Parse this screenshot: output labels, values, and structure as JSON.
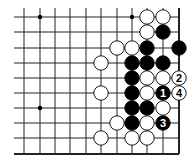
{
  "board": {
    "columns_x": [
      24,
      40,
      55,
      70,
      86,
      101,
      117,
      132,
      147,
      163,
      179
    ],
    "rows_y": [
      17,
      32,
      48,
      63,
      78,
      93,
      108,
      123,
      138,
      154
    ],
    "line_left": 14,
    "line_top": 8,
    "edges": {
      "top": false,
      "left": false,
      "right": true,
      "bottom": true
    },
    "stone_radius": 7.2,
    "colors": {
      "black": "#000000",
      "white": "#ffffff",
      "line": "#222222"
    },
    "star_points": [
      [
        1,
        0
      ],
      [
        7,
        0
      ],
      [
        1,
        6
      ]
    ]
  },
  "stones": [
    {
      "col": 8,
      "row": 0,
      "color": "white"
    },
    {
      "col": 9,
      "row": 0,
      "color": "white"
    },
    {
      "col": 8,
      "row": 1,
      "color": "white"
    },
    {
      "col": 9,
      "row": 1,
      "color": "black"
    },
    {
      "col": 6,
      "row": 2,
      "color": "white"
    },
    {
      "col": 7,
      "row": 2,
      "color": "white"
    },
    {
      "col": 8,
      "row": 2,
      "color": "black"
    },
    {
      "col": 10,
      "row": 2,
      "color": "black"
    },
    {
      "col": 5,
      "row": 3,
      "color": "white"
    },
    {
      "col": 7,
      "row": 3,
      "color": "black"
    },
    {
      "col": 8,
      "row": 3,
      "color": "black"
    },
    {
      "col": 9,
      "row": 3,
      "color": "black"
    },
    {
      "col": 7,
      "row": 4,
      "color": "black"
    },
    {
      "col": 8,
      "row": 4,
      "color": "white"
    },
    {
      "col": 9,
      "row": 4,
      "color": "white"
    },
    {
      "col": 10,
      "row": 4,
      "color": "white",
      "label": "2"
    },
    {
      "col": 5,
      "row": 5,
      "color": "white"
    },
    {
      "col": 7,
      "row": 5,
      "color": "black"
    },
    {
      "col": 8,
      "row": 5,
      "color": "white"
    },
    {
      "col": 9,
      "row": 5,
      "color": "black",
      "label": "1"
    },
    {
      "col": 10,
      "row": 5,
      "color": "white",
      "label": "4"
    },
    {
      "col": 7,
      "row": 6,
      "color": "black"
    },
    {
      "col": 8,
      "row": 6,
      "color": "black"
    },
    {
      "col": 9,
      "row": 6,
      "color": "white"
    },
    {
      "col": 6,
      "row": 7,
      "color": "white"
    },
    {
      "col": 7,
      "row": 7,
      "color": "black"
    },
    {
      "col": 8,
      "row": 7,
      "color": "white"
    },
    {
      "col": 9,
      "row": 7,
      "color": "black",
      "label": "3"
    },
    {
      "col": 5,
      "row": 8,
      "color": "white"
    },
    {
      "col": 7,
      "row": 8,
      "color": "white"
    },
    {
      "col": 8,
      "row": 8,
      "color": "white"
    }
  ]
}
